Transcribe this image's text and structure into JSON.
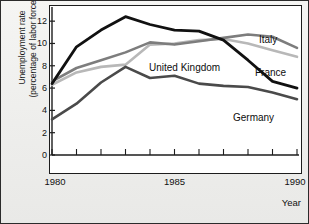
{
  "axes": {
    "y_title": "Unemployment rate\n(percentage of labor force)",
    "x_title": "Year",
    "y_ticks": [
      "0",
      "2",
      "4",
      "6",
      "8",
      "10",
      "12"
    ],
    "x_ticks_labeled": [
      "1980",
      "1985",
      "1990"
    ]
  },
  "labels": {
    "italy": "Italy",
    "france": "France",
    "united_kingdom": "United Kingdom",
    "germany": "Germany"
  },
  "colors": {
    "united_kingdom": "#111111",
    "germany": "#4a4a4a",
    "italy": "#7d7d7d",
    "france": "#b8b8b8",
    "axis": "#1d1d1d",
    "plot_background": "#ffffff",
    "page_background": "#f0f0ee"
  },
  "chart_data": {
    "type": "line",
    "title": "",
    "xlabel": "Year",
    "ylabel": "Unemployment rate (percentage of labor force)",
    "x": [
      1980,
      1981,
      1982,
      1983,
      1984,
      1985,
      1986,
      1987,
      1988,
      1989,
      1990
    ],
    "xlim": [
      1980,
      1990
    ],
    "ylim": [
      0,
      13
    ],
    "yticks": [
      0,
      2,
      4,
      6,
      8,
      10,
      12
    ],
    "xticks": [
      1980,
      1981,
      1982,
      1983,
      1984,
      1985,
      1986,
      1987,
      1988,
      1989,
      1990
    ],
    "xticks_labeled": [
      1980,
      1985,
      1990
    ],
    "grid": false,
    "legend": "inline-labels",
    "series": [
      {
        "name": "United Kingdom",
        "color": "#111111",
        "values": [
          6.4,
          9.7,
          11.2,
          12.4,
          11.7,
          11.2,
          11.1,
          10.3,
          8.5,
          6.6,
          6.0
        ]
      },
      {
        "name": "Italy",
        "color": "#7d7d7d",
        "values": [
          6.6,
          7.8,
          8.5,
          9.2,
          10.1,
          9.9,
          10.2,
          10.5,
          10.8,
          10.6,
          9.6
        ]
      },
      {
        "name": "France",
        "color": "#b8b8b8",
        "values": [
          6.3,
          7.4,
          7.9,
          8.1,
          9.9,
          10.0,
          10.3,
          10.4,
          10.0,
          9.4,
          8.8
        ]
      },
      {
        "name": "Germany",
        "color": "#4a4a4a",
        "values": [
          3.2,
          4.6,
          6.5,
          7.9,
          6.9,
          7.1,
          6.4,
          6.2,
          6.1,
          5.6,
          5.0
        ]
      }
    ]
  }
}
